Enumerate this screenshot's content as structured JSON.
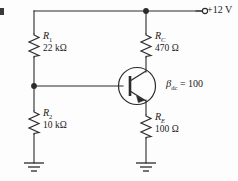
{
  "figure": {
    "background_color": "#fdfdfd",
    "line_color": "#2b2b2b"
  },
  "supply": {
    "terminal_label": "+12 V",
    "voltage": 12,
    "unit": "V",
    "terminal_type": "open-circle"
  },
  "components": {
    "r1": {
      "name": "R",
      "subscript": "1",
      "value": "22 kΩ",
      "resistance": 22000
    },
    "r2": {
      "name": "R",
      "subscript": "2",
      "value": "10 kΩ",
      "resistance": 10000
    },
    "rc": {
      "name": "R",
      "subscript": "C",
      "value": "470 Ω",
      "resistance": 470
    },
    "re": {
      "name": "R",
      "subscript": "E",
      "value": "100 Ω",
      "resistance": 100
    },
    "transistor": {
      "type": "npn-bjt",
      "beta_symbol": "β",
      "beta_subscript": "dc",
      "beta_equals": "=",
      "beta_value": "100"
    },
    "ground_left": {
      "symbol": "ground"
    },
    "ground_right": {
      "symbol": "ground"
    }
  },
  "nodes": {
    "top_rail_junction": "collector-supply-node",
    "base_junction": "voltage-divider-base-node"
  }
}
